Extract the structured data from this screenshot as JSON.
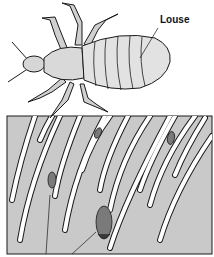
{
  "figure": {
    "labels": {
      "louse": "Louse"
    },
    "parts": {
      "louse": "louse (insect, top view)",
      "scalp": "scalp / skin cross-section",
      "hairs": "hair shafts",
      "nits": "nits (eggs) attached to hair"
    },
    "colors": {
      "outline": "#1a1a1a",
      "body_fill": "#dcdcdc",
      "scalp_fill": "#c9c9c9",
      "hair_fill": "#ffffff",
      "nit_fill": "#7a7a7a",
      "background": "#ffffff"
    }
  }
}
